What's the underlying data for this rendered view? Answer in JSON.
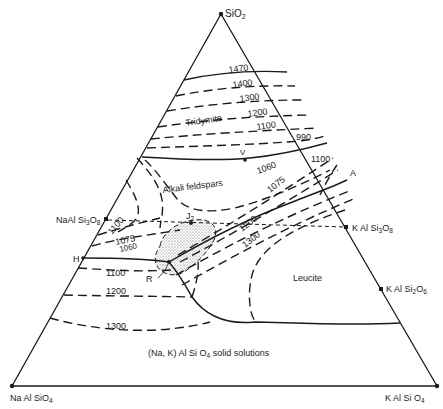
{
  "diagram": {
    "type": "ternary phase diagram",
    "vertices": {
      "top": "SiO",
      "top_sub": "2",
      "bottom_left": "Na Al SiO",
      "bottom_left_sub": "4",
      "bottom_right": "K Al Si O",
      "bottom_right_sub": "4"
    },
    "side_points": {
      "naalsi3o8": {
        "text": "NaAl Si",
        "sub1": "3",
        "mid": "O",
        "sub2": "8"
      },
      "kalsi3o8": {
        "text": "K Al Si",
        "sub1": "3",
        "mid": "O",
        "sub2": "8"
      },
      "kalsi2o6": {
        "text": "K Al Si",
        "sub1": "2",
        "mid": "O",
        "sub2": "6"
      }
    },
    "fields": {
      "tridymite": "Tridymite",
      "alkali_feldspars": "Alkali feldspars",
      "leucite": "Leucite",
      "solid_solutions_pre": "(Na, K) Al Si O",
      "solid_solutions_sub": "4",
      "solid_solutions_post": " solid solutions"
    },
    "points": {
      "H": "H",
      "R": "R",
      "J2": "J",
      "J2_sub": "2",
      "V": "V",
      "A": "A"
    },
    "isotherms": {
      "t1470": "1470",
      "t1400": "1400",
      "t1300_top": "1300",
      "t1200_top": "1200",
      "t1100_top": "1100",
      "t990": "990",
      "t1100_right": "1100",
      "t1060": "1060",
      "t1075_right": "1075",
      "t1100_left": "1100",
      "t1075_left": "1075",
      "t1060_left": "1060",
      "t1200_mid": "1200",
      "t1300_mid": "1300",
      "t1100_low": "1100",
      "t1200_low": "1200",
      "t1300_low": "1300"
    }
  }
}
